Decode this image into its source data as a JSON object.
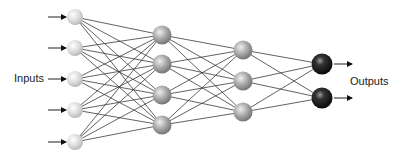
{
  "diagram": {
    "type": "feedforward-neural-network",
    "labels": {
      "inputs": "Inputs",
      "outputs": "Outputs"
    },
    "colors": {
      "background": "#ffffff",
      "edge": "#3a3a3a",
      "input_node": "#d9d9d9",
      "hidden_node": "#a6a6a6",
      "output_node": "#1a1a1a"
    },
    "layers": [
      {
        "name": "input",
        "x": 75,
        "r": 8,
        "ys": [
          17,
          48,
          79,
          110,
          142
        ]
      },
      {
        "name": "hidden-1",
        "x": 162,
        "r": 9.5,
        "ys": [
          35,
          64,
          95,
          125
        ]
      },
      {
        "name": "hidden-2",
        "x": 243,
        "r": 9.5,
        "ys": [
          50,
          81,
          112
        ]
      },
      {
        "name": "output",
        "x": 322,
        "r": 10.5,
        "ys": [
          64,
          98
        ]
      }
    ],
    "input_arrows": {
      "x1": 48,
      "x2": 66
    },
    "output_arrows": {
      "x1": 334,
      "x2": 352
    },
    "inputs_label_pos": {
      "x": 14,
      "y": 82
    },
    "outputs_label_pos": {
      "x": 350,
      "y": 85
    }
  }
}
